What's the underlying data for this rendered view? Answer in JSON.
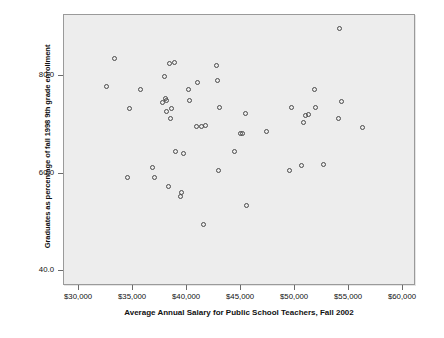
{
  "chart_data": {
    "type": "scatter",
    "title": "",
    "xlabel": "Average Annual Salary for Public School Teachers, Fall 2002",
    "ylabel": "Graduates as percentage of fall 1998 9th grade enrollment",
    "xlim": [
      28600,
      61200
    ],
    "ylim": [
      37.0,
      92.5
    ],
    "grid": false,
    "legend": null,
    "xticks": [
      30000,
      35000,
      40000,
      45000,
      50000,
      55000,
      60000
    ],
    "xtick_labels": [
      "$30,000",
      "$35,000",
      "$40,000",
      "$45,000",
      "$50,000",
      "$55,000",
      "$60,000"
    ],
    "yticks": [
      40.0,
      60.0,
      80.0
    ],
    "ytick_labels": [
      "40.0",
      "60.0",
      "80.0"
    ],
    "marker": "open-circle",
    "marker_color": "#4a4a4a",
    "plot_background": "#ededed",
    "points": [
      {
        "x": 32500,
        "y": 77.8
      },
      {
        "x": 33300,
        "y": 83.5
      },
      {
        "x": 34500,
        "y": 59.2
      },
      {
        "x": 34700,
        "y": 73.4
      },
      {
        "x": 35700,
        "y": 77.3
      },
      {
        "x": 36800,
        "y": 61.3
      },
      {
        "x": 37000,
        "y": 59.2
      },
      {
        "x": 37700,
        "y": 74.5
      },
      {
        "x": 37900,
        "y": 80.0
      },
      {
        "x": 38000,
        "y": 75.3
      },
      {
        "x": 38100,
        "y": 75.0
      },
      {
        "x": 38100,
        "y": 72.8
      },
      {
        "x": 38300,
        "y": 57.3
      },
      {
        "x": 38400,
        "y": 82.5
      },
      {
        "x": 38500,
        "y": 71.3
      },
      {
        "x": 38600,
        "y": 73.4
      },
      {
        "x": 38800,
        "y": 82.8
      },
      {
        "x": 38900,
        "y": 64.6
      },
      {
        "x": 39400,
        "y": 55.4
      },
      {
        "x": 39500,
        "y": 56.2
      },
      {
        "x": 39700,
        "y": 64.2
      },
      {
        "x": 40100,
        "y": 77.2
      },
      {
        "x": 40200,
        "y": 74.9
      },
      {
        "x": 40900,
        "y": 69.7
      },
      {
        "x": 41000,
        "y": 78.6
      },
      {
        "x": 41300,
        "y": 69.6
      },
      {
        "x": 41500,
        "y": 49.6
      },
      {
        "x": 41700,
        "y": 69.8
      },
      {
        "x": 42700,
        "y": 82.2
      },
      {
        "x": 42800,
        "y": 79.0
      },
      {
        "x": 42900,
        "y": 60.6
      },
      {
        "x": 43000,
        "y": 73.5
      },
      {
        "x": 44400,
        "y": 64.6
      },
      {
        "x": 44900,
        "y": 68.3
      },
      {
        "x": 45100,
        "y": 68.3
      },
      {
        "x": 45400,
        "y": 72.4
      },
      {
        "x": 45500,
        "y": 53.4
      },
      {
        "x": 47400,
        "y": 68.6
      },
      {
        "x": 49500,
        "y": 60.7
      },
      {
        "x": 49700,
        "y": 73.6
      },
      {
        "x": 50600,
        "y": 61.7
      },
      {
        "x": 50800,
        "y": 70.5
      },
      {
        "x": 51000,
        "y": 72.0
      },
      {
        "x": 51200,
        "y": 72.1
      },
      {
        "x": 51800,
        "y": 77.2
      },
      {
        "x": 51900,
        "y": 73.5
      },
      {
        "x": 52600,
        "y": 61.9
      },
      {
        "x": 54000,
        "y": 71.4
      },
      {
        "x": 54100,
        "y": 89.8
      },
      {
        "x": 54300,
        "y": 74.8
      },
      {
        "x": 56200,
        "y": 69.4
      }
    ]
  }
}
